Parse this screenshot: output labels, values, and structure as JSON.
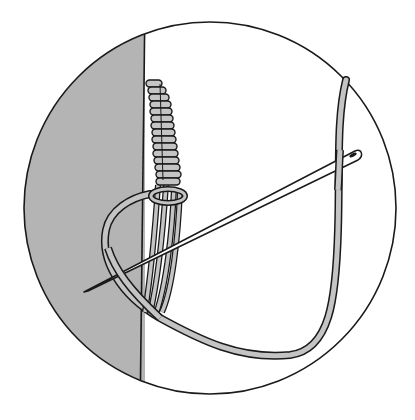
{
  "figure": {
    "colors": {
      "background": "#ffffff",
      "outline": "#1a1a1a",
      "fabric_fill": "#b4b4b4",
      "thread_fill": "#c4c4c4",
      "needle_fill": "#ffffff"
    },
    "elements": [
      "circle-frame",
      "fabric-panel",
      "wrapped-bar-stitches",
      "loop-knot",
      "working-thread",
      "needle"
    ]
  }
}
